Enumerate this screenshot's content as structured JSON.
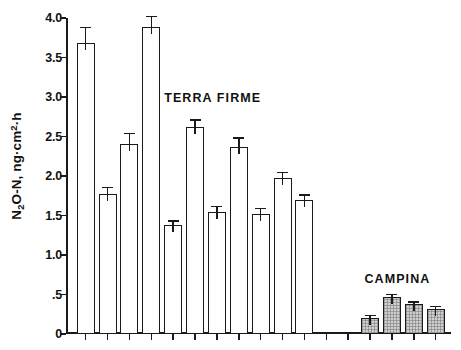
{
  "chart_data": {
    "type": "bar",
    "title": "",
    "xlabel": "",
    "ylabel": "N2O-N, ng·cm-2·h",
    "ylabel_parts": {
      "prefix": "N",
      "sub1": "2",
      "mid": "O-N, ng",
      "dot1": "·",
      "cm": "cm",
      "sup": "2",
      "dot2": "·",
      "suffix": "h"
    },
    "ylim": [
      0,
      4.0
    ],
    "yticks": [
      0,
      0.5,
      1.0,
      1.5,
      2.0,
      2.5,
      3.0,
      3.5,
      4.0
    ],
    "ytick_labels": [
      "0",
      ".5",
      "1.0",
      "1.5",
      "2.0",
      "2.5",
      "3.0",
      "3.5",
      "4.0"
    ],
    "grid": false,
    "legend_position": "none",
    "xtick_count": 17,
    "annotations": [
      {
        "text": "TERRA FIRME",
        "x_frac": 0.255,
        "y_value": 3.07
      },
      {
        "text": "CAMPINA",
        "x_frac": 0.775,
        "y_value": 0.78
      }
    ],
    "series": [
      {
        "name": "TERRA FIRME",
        "fill": "open",
        "fill_color": "#ffffff",
        "edge_color": "#1a1a1a",
        "values": [
          3.68,
          1.77,
          2.4,
          3.88,
          1.38,
          2.62,
          1.55,
          2.37,
          1.52,
          1.98,
          1.7
        ],
        "errors": [
          0.21,
          0.09,
          0.15,
          0.15,
          0.06,
          0.1,
          0.07,
          0.12,
          0.08,
          0.07,
          0.07
        ],
        "slots": [
          0,
          1,
          2,
          3,
          4,
          5,
          6,
          7,
          8,
          9,
          10
        ]
      },
      {
        "name": "CAMPINA",
        "fill": "hatched",
        "fill_color": "#cfcfcf",
        "edge_color": "#1a1a1a",
        "values": [
          0.2,
          0.47,
          0.38,
          0.32
        ],
        "errors": [
          0.045,
          0.035,
          0.035,
          0.035
        ],
        "slots": [
          13,
          14,
          15,
          16
        ]
      }
    ]
  }
}
